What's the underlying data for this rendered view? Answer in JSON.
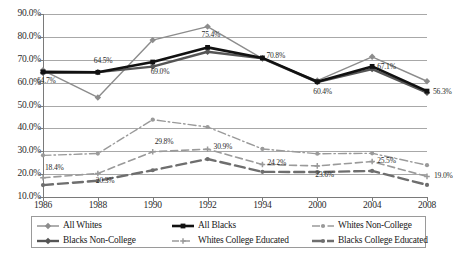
{
  "chart_data": {
    "type": "line",
    "title": "",
    "xlabel": "",
    "ylabel": "",
    "categories": [
      "1986",
      "1988",
      "1990",
      "1992",
      "1994",
      "2000",
      "2004",
      "2008"
    ],
    "ylim": [
      10.0,
      90.0
    ],
    "ytick_step": 10.0,
    "ytick_labels": [
      "90.0%",
      "80.0%",
      "70.0%",
      "60.0%",
      "50.0%",
      "40.0%",
      "30.0%",
      "20.0%",
      "10.0%"
    ],
    "grid": true,
    "legend_position": "bottom",
    "value_suffix": "%",
    "series": [
      {
        "name": "All Whites",
        "color": "#8c8c8c",
        "style": "solid",
        "width": 1.4,
        "marker": "diamond",
        "values": [
          65.4,
          53.5,
          78.6,
          84.5,
          70.5,
          60.9,
          71.3,
          60.6
        ]
      },
      {
        "name": "All Blacks",
        "color": "#111111",
        "style": "solid",
        "width": 2.6,
        "marker": "square",
        "values": [
          64.7,
          64.5,
          69.0,
          75.4,
          70.8,
          60.4,
          67.1,
          56.3
        ]
      },
      {
        "name": "Whites Non-College",
        "color": "#9a9a9a",
        "style": "dash-dot",
        "width": 1.4,
        "marker": "dot",
        "values": [
          28.2,
          29.0,
          43.8,
          40.6,
          31.0,
          28.9,
          29.1,
          23.9
        ]
      },
      {
        "name": "Blacks Non-College",
        "color": "#555555",
        "style": "solid",
        "width": 2.4,
        "marker": "diamond",
        "values": [
          64.3,
          64.6,
          67.0,
          73.5,
          70.6,
          60.2,
          65.9,
          55.6
        ]
      },
      {
        "name": "Whites College Educated",
        "color": "#9a9a9a",
        "style": "dashed",
        "width": 1.6,
        "marker": "cross",
        "values": [
          18.4,
          20.3,
          29.8,
          30.9,
          24.2,
          23.6,
          25.5,
          19.0
        ]
      },
      {
        "name": "Blacks College Educated",
        "color": "#6e6e6e",
        "style": "long-dash",
        "width": 2.4,
        "marker": "dot",
        "values": [
          15.2,
          17.1,
          21.7,
          26.6,
          21.0,
          20.9,
          21.4,
          15.3
        ]
      }
    ],
    "data_labels": [
      {
        "series": "All Blacks",
        "category": "1986",
        "text": "64.7%"
      },
      {
        "series": "All Blacks",
        "category": "1988",
        "text": "64.5%"
      },
      {
        "series": "All Blacks",
        "category": "1990",
        "text": "69.0%"
      },
      {
        "series": "All Blacks",
        "category": "1992",
        "text": "75.4%"
      },
      {
        "series": "All Blacks",
        "category": "1994",
        "text": "70.8%"
      },
      {
        "series": "All Blacks",
        "category": "2000",
        "text": "60.4%"
      },
      {
        "series": "All Blacks",
        "category": "2004",
        "text": "67.1%"
      },
      {
        "series": "All Blacks",
        "category": "2008",
        "text": "56.3%"
      },
      {
        "series": "Whites College Educated",
        "category": "1986",
        "text": "18.4%"
      },
      {
        "series": "Whites College Educated",
        "category": "1988",
        "text": "20.3%"
      },
      {
        "series": "Whites College Educated",
        "category": "1990",
        "text": "29.8%"
      },
      {
        "series": "Whites College Educated",
        "category": "1992",
        "text": "30.9%"
      },
      {
        "series": "Whites College Educated",
        "category": "1994",
        "text": "24.2%"
      },
      {
        "series": "Whites College Educated",
        "category": "2000",
        "text": "23.6%"
      },
      {
        "series": "Whites College Educated",
        "category": "2004",
        "text": "25.5%"
      },
      {
        "series": "Whites College Educated",
        "category": "2008",
        "text": "19.0%"
      }
    ]
  },
  "legend": {
    "items": [
      {
        "label": "All Whites"
      },
      {
        "label": "All Blacks"
      },
      {
        "label": "Whites Non-College"
      },
      {
        "label": "Blacks Non-College"
      },
      {
        "label": "Whites College Educated"
      },
      {
        "label": "Blacks College Educated"
      }
    ]
  },
  "caption": {
    "text": ""
  }
}
